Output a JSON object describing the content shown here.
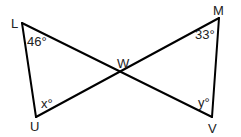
{
  "diagram": {
    "type": "geometry",
    "points": {
      "L": "L",
      "M": "M",
      "U": "U",
      "V": "V",
      "W": "W"
    },
    "segments": [
      "LU",
      "LV",
      "MU",
      "MV"
    ],
    "angles": {
      "L": "46°",
      "M": "33°",
      "U": "x°",
      "V": "y°"
    },
    "stroke_color": "#000000",
    "text_color": "#222222"
  }
}
